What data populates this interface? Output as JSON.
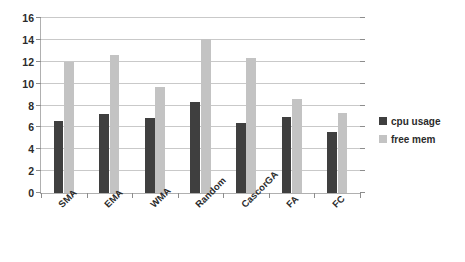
{
  "chart_data": {
    "type": "bar",
    "title": "",
    "xlabel": "",
    "ylabel": "",
    "ylim": [
      0,
      16
    ],
    "ytick_step": 2,
    "yticks": [
      "0",
      "2",
      "4",
      "6",
      "8",
      "10",
      "12",
      "14",
      "16"
    ],
    "grid": true,
    "legend_position": "right",
    "categories": [
      "SMA",
      "EMA",
      "WMA",
      "Random",
      "CascorGA",
      "FA",
      "FC"
    ],
    "series": [
      {
        "name": "cpu usage",
        "color": "#3f3f3f",
        "values": [
          6.6,
          7.2,
          6.85,
          8.3,
          6.4,
          6.95,
          5.6
        ]
      },
      {
        "name": "free mem",
        "color": "#c3c3c3",
        "values": [
          12.0,
          12.6,
          9.7,
          14.1,
          12.3,
          8.6,
          7.35
        ]
      }
    ]
  },
  "legend": {
    "items": [
      {
        "label": "cpu usage",
        "swatch": "cpu"
      },
      {
        "label": "free mem",
        "swatch": "mem"
      }
    ]
  },
  "colors": {
    "cpu_usage": "#3f3f3f",
    "free_mem": "#c3c3c3",
    "gridline": "#c9c9c9",
    "axis": "#b0b0b0",
    "text": "#2b2b2b",
    "background": "#ffffff"
  }
}
